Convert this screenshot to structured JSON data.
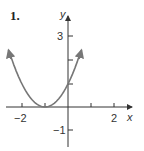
{
  "problem_number": "1.",
  "chart_data": {
    "type": "line",
    "title": "",
    "xlabel": "x",
    "ylabel": "y",
    "equation": "y = (x + 1)^2",
    "xlim": [
      -2.7,
      2.7
    ],
    "ylim": [
      -1.6,
      3.5
    ],
    "x_ticks": [
      -2,
      -1,
      1,
      2
    ],
    "x_tick_labels": [
      "-2",
      "2"
    ],
    "y_ticks": [
      -1,
      1,
      2,
      3
    ],
    "y_tick_labels": [
      "-1",
      "3"
    ],
    "grid": false,
    "vertex": [
      -1,
      0
    ],
    "y_intercept": [
      0,
      1
    ],
    "series": [
      {
        "name": "parabola",
        "x": [
          -2.6,
          -2,
          -1.5,
          -1,
          -0.5,
          0,
          0.5
        ],
        "values": [
          2.56,
          1,
          0.25,
          0,
          0.25,
          1,
          2.25
        ]
      }
    ],
    "color": "#777777"
  },
  "labels": {
    "x_axis": "x",
    "y_axis": "y",
    "tick_neg2": "−2",
    "tick_2": "2",
    "tick_3": "3",
    "tick_neg1": "−1"
  }
}
